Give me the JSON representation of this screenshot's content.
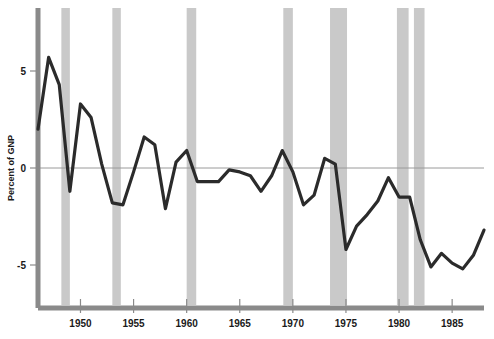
{
  "chart_data": {
    "type": "line",
    "title": "",
    "subtitle": "",
    "xlabel": "",
    "ylabel": "Percent of GNP",
    "xlim": [
      1946,
      1988
    ],
    "ylim": [
      -7.0,
      7.2
    ],
    "grid": false,
    "legend_position": "none",
    "zero_line": 0,
    "x_ticks": [
      1950,
      1955,
      1960,
      1965,
      1970,
      1975,
      1980,
      1985
    ],
    "x_tick_labels": [
      "1950",
      "1955",
      "1960",
      "1965",
      "1970",
      "1975",
      "1980",
      "1985"
    ],
    "y_ticks": [
      5,
      0,
      -5
    ],
    "y_tick_labels": [
      "5",
      "0",
      "-5"
    ],
    "series": [
      {
        "name": "Percent of GNP",
        "color": "#2b2b2b",
        "x": [
          1946,
          1947,
          1948,
          1949,
          1950,
          1951,
          1952,
          1953,
          1954,
          1955,
          1956,
          1957,
          1958,
          1959,
          1960,
          1961,
          1962,
          1963,
          1964,
          1965,
          1966,
          1967,
          1968,
          1969,
          1970,
          1971,
          1972,
          1973,
          1974,
          1975,
          1976,
          1977,
          1978,
          1979,
          1980,
          1981,
          1982,
          1983,
          1984,
          1985,
          1986,
          1987,
          1988
        ],
        "values": [
          2.0,
          5.7,
          4.3,
          -1.2,
          3.3,
          2.6,
          0.2,
          -1.8,
          -1.9,
          -0.2,
          1.6,
          1.2,
          -2.1,
          0.3,
          0.9,
          -0.7,
          -0.7,
          -0.7,
          -0.1,
          -0.2,
          -0.4,
          -1.2,
          -0.4,
          0.9,
          -0.2,
          -1.9,
          -1.4,
          0.5,
          0.2,
          -4.2,
          -3.0,
          -2.4,
          -1.7,
          -0.5,
          -1.5,
          -1.5,
          -3.7,
          -5.1,
          -4.4,
          -4.9,
          -5.2,
          -4.5,
          -3.2
        ]
      }
    ],
    "recession_bands": [
      {
        "start": 1948.2,
        "end": 1949.0,
        "color": "#c9c9c9"
      },
      {
        "start": 1953.0,
        "end": 1953.8,
        "color": "#c9c9c9"
      },
      {
        "start": 1960.0,
        "end": 1960.9,
        "color": "#c9c9c9"
      },
      {
        "start": 1969.1,
        "end": 1970.0,
        "color": "#c9c9c9"
      },
      {
        "start": 1973.5,
        "end": 1975.1,
        "color": "#c9c9c9"
      },
      {
        "start": 1979.8,
        "end": 1980.9,
        "color": "#c9c9c9"
      },
      {
        "start": 1981.4,
        "end": 1982.4,
        "color": "#c9c9c9"
      }
    ],
    "colors": {
      "line": "#2b2b2b",
      "recession_band": "#c9c9c9",
      "axis": "#8a8a8a",
      "zero_line": "#9a9a9a",
      "tick_text": "#1a1a1a",
      "background": "#ffffff"
    }
  }
}
